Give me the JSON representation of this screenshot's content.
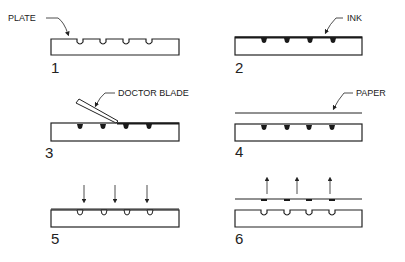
{
  "diagram": {
    "colors": {
      "stroke": "#222222",
      "ink": "#1a1a1a",
      "background": "#ffffff"
    },
    "panels": [
      {
        "step": "1",
        "label": "PLATE"
      },
      {
        "step": "2",
        "label": "INK"
      },
      {
        "step": "3",
        "label": "DOCTOR BLADE"
      },
      {
        "step": "4",
        "label": "PAPER"
      },
      {
        "step": "5",
        "label": ""
      },
      {
        "step": "6",
        "label": ""
      }
    ]
  }
}
